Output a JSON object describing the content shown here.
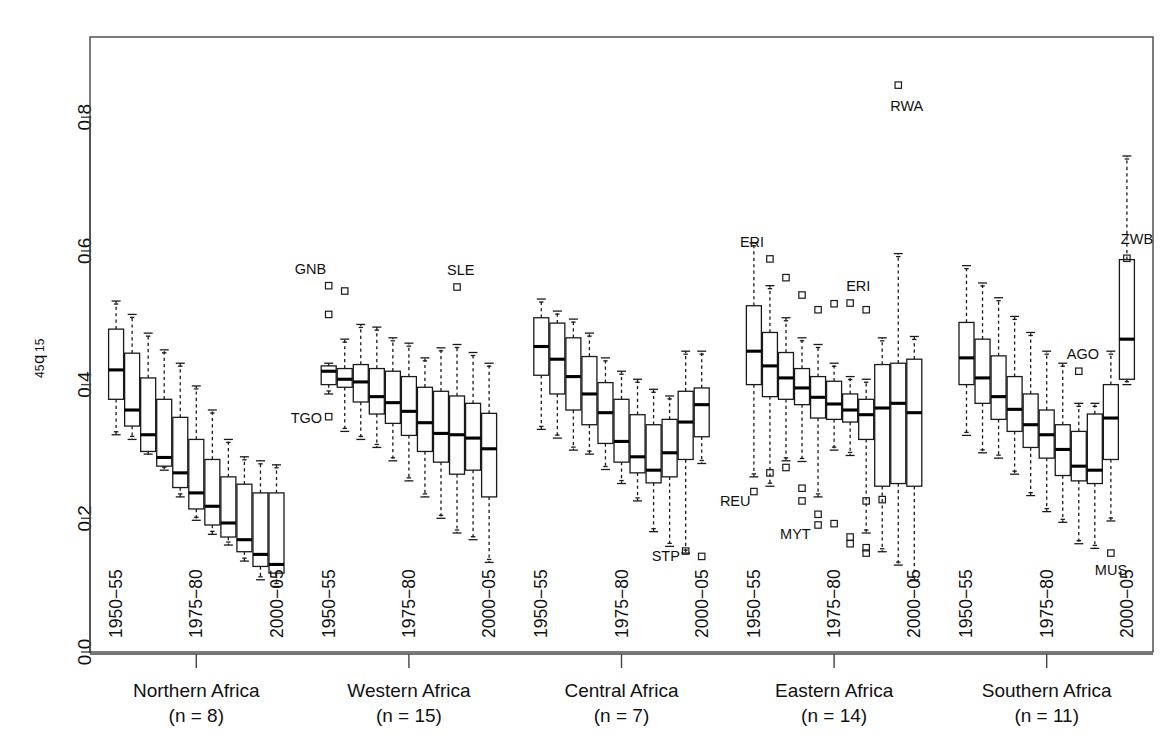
{
  "chart_data": {
    "type": "box",
    "title": "",
    "xlabel": "",
    "ylabel": "45q15",
    "ylabel_main": "45",
    "ylabel_q": "q",
    "ylabel_sub": "15",
    "ylim": [
      0.0,
      0.92
    ],
    "yticks": [
      0.0,
      0.2,
      0.4,
      0.6,
      0.8
    ],
    "ytick_labels": [
      "0.0",
      "0.2",
      "0.4",
      "0.6",
      "0.8"
    ],
    "grid": false,
    "legend": "none",
    "period_tick_labels": [
      "1950−55",
      "1975−80",
      "2000−05"
    ],
    "period_tick_indices": [
      0,
      5,
      10
    ],
    "n_periods": 11,
    "groups": [
      {
        "name": "Northern Africa",
        "n_label": "(n = 8)",
        "n": 8,
        "boxes": [
          {
            "period": "1950-55",
            "whislo": 0.325,
            "q1": 0.378,
            "med": 0.422,
            "q3": 0.483,
            "whishi": 0.525,
            "outliers": []
          },
          {
            "period": "1955-60",
            "whislo": 0.318,
            "q1": 0.338,
            "med": 0.362,
            "q3": 0.447,
            "whishi": 0.505,
            "outliers": []
          },
          {
            "period": "1960-65",
            "whislo": 0.296,
            "q1": 0.3,
            "med": 0.325,
            "q3": 0.41,
            "whishi": 0.477,
            "outliers": []
          },
          {
            "period": "1965-70",
            "whislo": 0.272,
            "q1": 0.278,
            "med": 0.291,
            "q3": 0.378,
            "whishi": 0.452,
            "outliers": []
          },
          {
            "period": "1970-75",
            "whislo": 0.232,
            "q1": 0.246,
            "med": 0.268,
            "q3": 0.351,
            "whishi": 0.432,
            "outliers": []
          },
          {
            "period": "1975-80",
            "whislo": 0.197,
            "q1": 0.214,
            "med": 0.238,
            "q3": 0.318,
            "whishi": 0.398,
            "outliers": []
          },
          {
            "period": "1980-85",
            "whislo": 0.176,
            "q1": 0.19,
            "med": 0.218,
            "q3": 0.288,
            "whishi": 0.362,
            "outliers": []
          },
          {
            "period": "1985-90",
            "whislo": 0.16,
            "q1": 0.172,
            "med": 0.193,
            "q3": 0.262,
            "whishi": 0.318,
            "outliers": []
          },
          {
            "period": "1990-95",
            "whislo": 0.136,
            "q1": 0.15,
            "med": 0.168,
            "q3": 0.251,
            "whishi": 0.292,
            "outliers": []
          },
          {
            "period": "1995-2000",
            "whislo": 0.108,
            "q1": 0.128,
            "med": 0.146,
            "q3": 0.238,
            "whishi": 0.286,
            "outliers": []
          },
          {
            "period": "2000-05",
            "whislo": 0.098,
            "q1": 0.118,
            "med": 0.131,
            "q3": 0.238,
            "whishi": 0.28,
            "outliers": []
          }
        ]
      },
      {
        "name": "Western Africa",
        "n_label": "(n = 15)",
        "n": 15,
        "boxes": [
          {
            "period": "1950-55",
            "whislo": 0.386,
            "q1": 0.4,
            "med": 0.42,
            "q3": 0.428,
            "whishi": 0.432,
            "outliers": [
              0.548,
              0.505,
              0.352
            ]
          },
          {
            "period": "1955-60",
            "whislo": 0.33,
            "q1": 0.396,
            "med": 0.408,
            "q3": 0.424,
            "whishi": 0.468,
            "outliers": [
              0.54
            ]
          },
          {
            "period": "1960-65",
            "whislo": 0.318,
            "q1": 0.374,
            "med": 0.404,
            "q3": 0.43,
            "whishi": 0.49,
            "outliers": []
          },
          {
            "period": "1965-70",
            "whislo": 0.306,
            "q1": 0.356,
            "med": 0.382,
            "q3": 0.424,
            "whishi": 0.486,
            "outliers": []
          },
          {
            "period": "1970-75",
            "whislo": 0.286,
            "q1": 0.342,
            "med": 0.373,
            "q3": 0.42,
            "whishi": 0.47,
            "outliers": []
          },
          {
            "period": "1975-80",
            "whislo": 0.256,
            "q1": 0.324,
            "med": 0.36,
            "q3": 0.412,
            "whishi": 0.462,
            "outliers": []
          },
          {
            "period": "1980-85",
            "whislo": 0.232,
            "q1": 0.3,
            "med": 0.343,
            "q3": 0.396,
            "whishi": 0.44,
            "outliers": []
          },
          {
            "period": "1985-90",
            "whislo": 0.2,
            "q1": 0.284,
            "med": 0.327,
            "q3": 0.39,
            "whishi": 0.455,
            "outliers": []
          },
          {
            "period": "1990-95",
            "whislo": 0.178,
            "q1": 0.266,
            "med": 0.325,
            "q3": 0.383,
            "whishi": 0.46,
            "outliers": [
              0.546
            ]
          },
          {
            "period": "1995-2000",
            "whislo": 0.168,
            "q1": 0.272,
            "med": 0.32,
            "q3": 0.372,
            "whishi": 0.448,
            "outliers": []
          },
          {
            "period": "2000-05",
            "whislo": 0.134,
            "q1": 0.232,
            "med": 0.304,
            "q3": 0.357,
            "whishi": 0.432,
            "outliers": []
          }
        ],
        "outlier_labels": [
          {
            "text": "GNB",
            "x_box": 0,
            "y": 0.548,
            "dx": -34,
            "dy": -12
          },
          {
            "text": "TGO",
            "x_box": 0,
            "y": 0.352,
            "dx": -38,
            "dy": 6
          },
          {
            "text": "SLE",
            "x_box": 8,
            "y": 0.546,
            "dx": -10,
            "dy": -12
          }
        ]
      },
      {
        "name": "Central Africa",
        "n_label": "(n = 7)",
        "n": 7,
        "boxes": [
          {
            "period": "1950-55",
            "whislo": 0.333,
            "q1": 0.414,
            "med": 0.457,
            "q3": 0.5,
            "whishi": 0.528,
            "outliers": []
          },
          {
            "period": "1955-60",
            "whislo": 0.32,
            "q1": 0.386,
            "med": 0.438,
            "q3": 0.492,
            "whishi": 0.51,
            "outliers": []
          },
          {
            "period": "1960-65",
            "whislo": 0.302,
            "q1": 0.362,
            "med": 0.412,
            "q3": 0.47,
            "whishi": 0.498,
            "outliers": []
          },
          {
            "period": "1965-70",
            "whislo": 0.296,
            "q1": 0.34,
            "med": 0.386,
            "q3": 0.442,
            "whishi": 0.477,
            "outliers": []
          },
          {
            "period": "1970-75",
            "whislo": 0.273,
            "q1": 0.312,
            "med": 0.358,
            "q3": 0.403,
            "whishi": 0.44,
            "outliers": []
          },
          {
            "period": "1975-80",
            "whislo": 0.252,
            "q1": 0.284,
            "med": 0.315,
            "q3": 0.378,
            "whishi": 0.42,
            "outliers": []
          },
          {
            "period": "1980-85",
            "whislo": 0.226,
            "q1": 0.268,
            "med": 0.292,
            "q3": 0.355,
            "whishi": 0.408,
            "outliers": []
          },
          {
            "period": "1985-90",
            "whislo": 0.18,
            "q1": 0.253,
            "med": 0.272,
            "q3": 0.34,
            "whishi": 0.393,
            "outliers": []
          },
          {
            "period": "1990-95",
            "whislo": 0.158,
            "q1": 0.262,
            "med": 0.298,
            "q3": 0.348,
            "whishi": 0.383,
            "outliers": []
          },
          {
            "period": "1995-2000",
            "whislo": 0.148,
            "q1": 0.288,
            "med": 0.344,
            "q3": 0.39,
            "whishi": 0.45,
            "outliers": [
              0.151
            ]
          },
          {
            "period": "2000-05",
            "whislo": 0.282,
            "q1": 0.322,
            "med": 0.37,
            "q3": 0.395,
            "whishi": 0.45,
            "outliers": [
              0.143
            ]
          }
        ],
        "outlier_labels": [
          {
            "text": "STP",
            "x_box": 9,
            "y": 0.151,
            "dx": -34,
            "dy": 10
          }
        ]
      },
      {
        "name": "Eastern Africa",
        "n_label": "(n = 14)",
        "n": 14,
        "boxes": [
          {
            "period": "1950-55",
            "whislo": 0.262,
            "q1": 0.4,
            "med": 0.45,
            "q3": 0.518,
            "whishi": 0.612,
            "outliers": [
              0.24
            ]
          },
          {
            "period": "1955-60",
            "whislo": 0.248,
            "q1": 0.382,
            "med": 0.428,
            "q3": 0.478,
            "whishi": 0.548,
            "outliers": [
              0.588,
              0.268
            ]
          },
          {
            "period": "1960-65",
            "whislo": 0.286,
            "q1": 0.378,
            "med": 0.41,
            "q3": 0.448,
            "whishi": 0.5,
            "outliers": [
              0.56,
              0.276
            ]
          },
          {
            "period": "1965-70",
            "whislo": 0.285,
            "q1": 0.37,
            "med": 0.395,
            "q3": 0.424,
            "whishi": 0.47,
            "outliers": [
              0.534,
              0.245,
              0.226
            ]
          },
          {
            "period": "1970-75",
            "whislo": 0.232,
            "q1": 0.35,
            "med": 0.381,
            "q3": 0.412,
            "whishi": 0.46,
            "outliers": [
              0.512,
              0.206,
              0.19
            ]
          },
          {
            "period": "1975-80",
            "whislo": 0.302,
            "q1": 0.348,
            "med": 0.371,
            "q3": 0.405,
            "whishi": 0.432,
            "outliers": [
              0.521,
              0.192
            ]
          },
          {
            "period": "1980-85",
            "whislo": 0.294,
            "q1": 0.344,
            "med": 0.362,
            "q3": 0.386,
            "whishi": 0.412,
            "outliers": [
              0.522,
              0.172,
              0.162
            ]
          },
          {
            "period": "1985-90",
            "whislo": 0.178,
            "q1": 0.318,
            "med": 0.355,
            "q3": 0.378,
            "whishi": 0.408,
            "outliers": [
              0.512,
              0.226,
              0.156,
              0.148
            ]
          },
          {
            "period": "1990-95",
            "whislo": 0.15,
            "q1": 0.248,
            "med": 0.365,
            "q3": 0.43,
            "whishi": 0.47,
            "outliers": [
              0.228
            ]
          },
          {
            "period": "1995-2000",
            "whislo": 0.13,
            "q1": 0.252,
            "med": 0.372,
            "q3": 0.432,
            "whishi": 0.596,
            "outliers": [
              0.848
            ]
          },
          {
            "period": "2000-05",
            "whislo": 0.108,
            "q1": 0.248,
            "med": 0.358,
            "q3": 0.438,
            "whishi": 0.472,
            "outliers": []
          }
        ],
        "outlier_labels": [
          {
            "text": "ERI",
            "x_box": 1,
            "y": 0.588,
            "dx": -30,
            "dy": -12
          },
          {
            "text": "ERI",
            "x_box": 6,
            "y": 0.522,
            "dx": -4,
            "dy": -12
          },
          {
            "text": "RWA",
            "x_box": 9,
            "y": 0.848,
            "dx": -8,
            "dy": 26
          },
          {
            "text": "REU",
            "x_box": 0,
            "y": 0.24,
            "dx": -34,
            "dy": 14
          },
          {
            "text": "MYT",
            "x_box": 4,
            "y": 0.19,
            "dx": -38,
            "dy": 14
          }
        ]
      },
      {
        "name": "Southern Africa",
        "n_label": "(n = 11)",
        "n": 11,
        "boxes": [
          {
            "period": "1950-55",
            "whislo": 0.324,
            "q1": 0.4,
            "med": 0.44,
            "q3": 0.493,
            "whishi": 0.578,
            "outliers": []
          },
          {
            "period": "1955-60",
            "whislo": 0.298,
            "q1": 0.372,
            "med": 0.41,
            "q3": 0.468,
            "whishi": 0.552,
            "outliers": []
          },
          {
            "period": "1960-65",
            "whislo": 0.29,
            "q1": 0.348,
            "med": 0.382,
            "q3": 0.443,
            "whishi": 0.53,
            "outliers": []
          },
          {
            "period": "1965-70",
            "whislo": 0.266,
            "q1": 0.33,
            "med": 0.363,
            "q3": 0.412,
            "whishi": 0.502,
            "outliers": []
          },
          {
            "period": "1970-75",
            "whislo": 0.234,
            "q1": 0.306,
            "med": 0.34,
            "q3": 0.386,
            "whishi": 0.478,
            "outliers": []
          },
          {
            "period": "1975-80",
            "whislo": 0.21,
            "q1": 0.29,
            "med": 0.325,
            "q3": 0.362,
            "whishi": 0.45,
            "outliers": []
          },
          {
            "period": "1980-85",
            "whislo": 0.194,
            "q1": 0.264,
            "med": 0.303,
            "q3": 0.34,
            "whishi": 0.432,
            "outliers": []
          },
          {
            "period": "1985-90",
            "whislo": 0.162,
            "q1": 0.256,
            "med": 0.278,
            "q3": 0.33,
            "whishi": 0.372,
            "outliers": [
              0.42
            ]
          },
          {
            "period": "1990-95",
            "whislo": 0.155,
            "q1": 0.252,
            "med": 0.272,
            "q3": 0.356,
            "whishi": 0.372,
            "outliers": []
          },
          {
            "period": "1995-2000",
            "whislo": 0.196,
            "q1": 0.288,
            "med": 0.35,
            "q3": 0.4,
            "whishi": 0.45,
            "outliers": [
              0.148
            ]
          },
          {
            "period": "2000-05",
            "whislo": 0.4,
            "q1": 0.408,
            "med": 0.468,
            "q3": 0.587,
            "whishi": 0.742,
            "outliers": [
              0.589
            ]
          }
        ],
        "outlier_labels": [
          {
            "text": "AGO",
            "x_box": 7,
            "y": 0.42,
            "dx": -12,
            "dy": -12
          },
          {
            "text": "MUS",
            "x_box": 9,
            "y": 0.148,
            "dx": -16,
            "dy": 22
          },
          {
            "text": "ZWB",
            "x_box": 9,
            "y": 0.589,
            "dx": 10,
            "dy": -14
          }
        ]
      }
    ]
  },
  "colors": {
    "stroke": "#1a1a1a",
    "frame": "#444444",
    "background": "#ffffff"
  }
}
